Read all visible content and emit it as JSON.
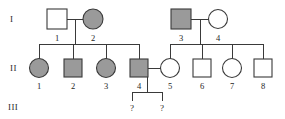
{
  "figure": {
    "kind": "pedigree-chart",
    "background_color": "#ffffff",
    "line_color": "#3a3a3a",
    "affected_fill": "#9a9a9a",
    "unaffected_fill": "#ffffff",
    "text_color": "#1e1e1e"
  },
  "generations": [
    {
      "key": "I",
      "label": "I"
    },
    {
      "key": "II",
      "label": "II"
    },
    {
      "key": "III",
      "label": "III"
    }
  ],
  "individuals": [
    {
      "id": "I-1",
      "number": "1",
      "generation": "I",
      "sex": "male",
      "shape": "square",
      "affected": false,
      "status": "unaffected",
      "cx": 57,
      "cy": 19
    },
    {
      "id": "I-2",
      "number": "2",
      "generation": "I",
      "sex": "female",
      "shape": "circle",
      "affected": true,
      "status": "affected",
      "cx": 93,
      "cy": 19
    },
    {
      "id": "I-3",
      "number": "3",
      "generation": "I",
      "sex": "male",
      "shape": "square",
      "affected": true,
      "status": "affected",
      "cx": 181,
      "cy": 19
    },
    {
      "id": "I-4",
      "number": "4",
      "generation": "I",
      "sex": "female",
      "shape": "circle",
      "affected": false,
      "status": "unaffected",
      "cx": 218,
      "cy": 19
    },
    {
      "id": "II-1",
      "number": "1",
      "generation": "II",
      "sex": "female",
      "shape": "circle",
      "affected": true,
      "status": "affected",
      "cx": 39,
      "cy": 68
    },
    {
      "id": "II-2",
      "number": "2",
      "generation": "II",
      "sex": "male",
      "shape": "square",
      "affected": true,
      "status": "affected",
      "cx": 73,
      "cy": 68
    },
    {
      "id": "II-3",
      "number": "3",
      "generation": "II",
      "sex": "female",
      "shape": "circle",
      "affected": true,
      "status": "affected",
      "cx": 106,
      "cy": 68
    },
    {
      "id": "II-4",
      "number": "4",
      "generation": "II",
      "sex": "male",
      "shape": "square",
      "affected": true,
      "status": "affected",
      "cx": 139,
      "cy": 68
    },
    {
      "id": "II-5",
      "number": "5",
      "generation": "II",
      "sex": "female",
      "shape": "circle",
      "affected": false,
      "status": "unaffected",
      "cx": 170,
      "cy": 68
    },
    {
      "id": "II-6",
      "number": "6",
      "generation": "II",
      "sex": "male",
      "shape": "square",
      "affected": false,
      "status": "unaffected",
      "cx": 202,
      "cy": 68
    },
    {
      "id": "II-7",
      "number": "7",
      "generation": "II",
      "sex": "female",
      "shape": "circle",
      "affected": false,
      "status": "unaffected",
      "cx": 232,
      "cy": 68
    },
    {
      "id": "II-8",
      "number": "8",
      "generation": "II",
      "sex": "male",
      "shape": "square",
      "affected": false,
      "status": "unaffected",
      "cx": 263,
      "cy": 68
    },
    {
      "id": "III-1",
      "number": "?",
      "generation": "III",
      "sex": "unknown",
      "shape": "none",
      "affected": false,
      "status": "unknown",
      "cx": 132,
      "cy": 110
    },
    {
      "id": "III-2",
      "number": "?",
      "generation": "III",
      "sex": "unknown",
      "shape": "none",
      "affected": false,
      "status": "unknown",
      "cx": 162,
      "cy": 110
    }
  ],
  "matings": [
    {
      "id": "mating-I-1-x-I-2",
      "partners": [
        "I-1",
        "I-2"
      ],
      "children": [
        "II-1",
        "II-2",
        "II-3",
        "II-4"
      ]
    },
    {
      "id": "mating-I-3-x-I-4",
      "partners": [
        "I-3",
        "I-4"
      ],
      "children": [
        "II-5",
        "II-6",
        "II-7",
        "II-8"
      ]
    },
    {
      "id": "mating-II-4-x-II-5",
      "partners": [
        "II-4",
        "II-5"
      ],
      "children": [
        "III-1",
        "III-2"
      ]
    }
  ],
  "labels": {
    "gen1": "I",
    "gen2": "II",
    "gen3": "III",
    "i1": "1",
    "i2": "2",
    "i3": "3",
    "i4": "4",
    "ii1": "1",
    "ii2": "2",
    "ii3": "3",
    "ii4": "4",
    "ii5": "5",
    "ii6": "6",
    "ii7": "7",
    "ii8": "8",
    "iii1": "?",
    "iii2": "?"
  }
}
